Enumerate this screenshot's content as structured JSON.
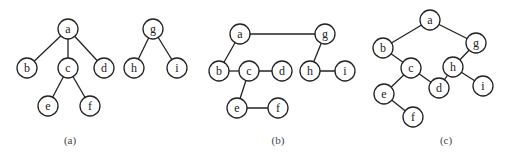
{
  "diagram": {
    "panels": [
      {
        "id": "a",
        "caption": "(a)",
        "caption_pos": [
          70,
          140
        ],
        "nodes": [
          {
            "id": "a",
            "label": "a",
            "x": 68,
            "y": 29
          },
          {
            "id": "b",
            "label": "b",
            "x": 27,
            "y": 68
          },
          {
            "id": "c",
            "label": "c",
            "x": 68,
            "y": 68
          },
          {
            "id": "d",
            "label": "d",
            "x": 104,
            "y": 68
          },
          {
            "id": "e",
            "label": "e",
            "x": 48,
            "y": 106
          },
          {
            "id": "f",
            "label": "f",
            "x": 90,
            "y": 106
          },
          {
            "id": "g",
            "label": "g",
            "x": 153,
            "y": 29
          },
          {
            "id": "h",
            "label": "h",
            "x": 134,
            "y": 68
          },
          {
            "id": "i",
            "label": "i",
            "x": 177,
            "y": 68
          }
        ],
        "edges": [
          [
            "a",
            "b"
          ],
          [
            "a",
            "c"
          ],
          [
            "a",
            "d"
          ],
          [
            "c",
            "e"
          ],
          [
            "c",
            "f"
          ],
          [
            "g",
            "h"
          ],
          [
            "g",
            "i"
          ]
        ]
      },
      {
        "id": "b",
        "caption": "(b)",
        "caption_pos": [
          278,
          140
        ],
        "nodes": [
          {
            "id": "a",
            "label": "a",
            "x": 240,
            "y": 34
          },
          {
            "id": "g",
            "label": "g",
            "x": 325,
            "y": 34
          },
          {
            "id": "b",
            "label": "b",
            "x": 219,
            "y": 71
          },
          {
            "id": "c",
            "label": "c",
            "x": 249,
            "y": 71
          },
          {
            "id": "d",
            "label": "d",
            "x": 282,
            "y": 71
          },
          {
            "id": "h",
            "label": "h",
            "x": 310,
            "y": 71
          },
          {
            "id": "i",
            "label": "i",
            "x": 345,
            "y": 71
          },
          {
            "id": "e",
            "label": "e",
            "x": 237,
            "y": 108
          },
          {
            "id": "f",
            "label": "f",
            "x": 278,
            "y": 108
          }
        ],
        "edges": [
          [
            "a",
            "g"
          ],
          [
            "a",
            "b"
          ],
          [
            "b",
            "c"
          ],
          [
            "c",
            "d"
          ],
          [
            "g",
            "h"
          ],
          [
            "h",
            "i"
          ],
          [
            "c",
            "e"
          ],
          [
            "e",
            "f"
          ]
        ]
      },
      {
        "id": "c",
        "caption": "(c)",
        "caption_pos": [
          446,
          140
        ],
        "nodes": [
          {
            "id": "a",
            "label": "a",
            "x": 430,
            "y": 20
          },
          {
            "id": "b",
            "label": "b",
            "x": 383,
            "y": 48
          },
          {
            "id": "g",
            "label": "g",
            "x": 476,
            "y": 43
          },
          {
            "id": "c",
            "label": "c",
            "x": 411,
            "y": 68
          },
          {
            "id": "h",
            "label": "h",
            "x": 453,
            "y": 67
          },
          {
            "id": "d",
            "label": "d",
            "x": 439,
            "y": 88
          },
          {
            "id": "i",
            "label": "i",
            "x": 483,
            "y": 86
          },
          {
            "id": "e",
            "label": "e",
            "x": 384,
            "y": 94
          },
          {
            "id": "f",
            "label": "f",
            "x": 413,
            "y": 117
          }
        ],
        "edges": [
          [
            "a",
            "b"
          ],
          [
            "a",
            "g"
          ],
          [
            "b",
            "c"
          ],
          [
            "c",
            "e"
          ],
          [
            "c",
            "d"
          ],
          [
            "g",
            "h"
          ],
          [
            "h",
            "d"
          ],
          [
            "h",
            "i"
          ],
          [
            "e",
            "f"
          ]
        ]
      }
    ],
    "node_radius": 10
  }
}
